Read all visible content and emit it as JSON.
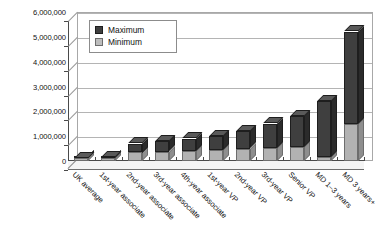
{
  "chart_data": {
    "type": "bar",
    "title": "",
    "xlabel": "",
    "ylabel": "",
    "ylim": [
      0,
      6000000
    ],
    "ytick_labels": [
      "6,000,000",
      "5,000,000",
      "4,000,000",
      "3,000,000",
      "2,000,000",
      "1,000,000",
      "0"
    ],
    "ytick_values": [
      6000000,
      5000000,
      4000000,
      3000000,
      2000000,
      1000000,
      0
    ],
    "grid": true,
    "legend_position": "top-left-inside",
    "three_d": true,
    "categories": [
      "UK average",
      "1st-year associate",
      "2nd-year associate",
      "3rd-year associate",
      "4th-year associate",
      "1st-year VP",
      "2nd-year VP",
      "3rd-year VP",
      "Senior VP",
      "MD 1–3 years",
      "MD 3 years+"
    ],
    "series": [
      {
        "name": "Maximum",
        "color": "#3f3f3f",
        "values": [
          120000,
          150000,
          700000,
          800000,
          900000,
          1000000,
          1200000,
          1500000,
          1800000,
          2400000,
          5200000
        ]
      },
      {
        "name": "Minimum",
        "color": "#b2b2b2",
        "values": [
          110000,
          130000,
          350000,
          380000,
          420000,
          450000,
          500000,
          520000,
          560000,
          150000,
          1500000
        ]
      }
    ]
  },
  "legend": {
    "items": [
      {
        "label": "Maximum",
        "swatch": "max"
      },
      {
        "label": "Minimum",
        "swatch": "min"
      }
    ]
  }
}
